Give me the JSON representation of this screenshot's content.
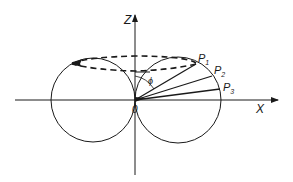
{
  "diagram": {
    "axes": {
      "z_label": "Z",
      "x_label": "X",
      "origin_label": "0"
    },
    "angle_label": "ϕ",
    "points": [
      {
        "label": "P",
        "sub": "1"
      },
      {
        "label": "P",
        "sub": "2"
      },
      {
        "label": "P",
        "sub": "3"
      }
    ],
    "colors": {
      "stroke": "#1a1a1a",
      "background": "#ffffff"
    }
  }
}
